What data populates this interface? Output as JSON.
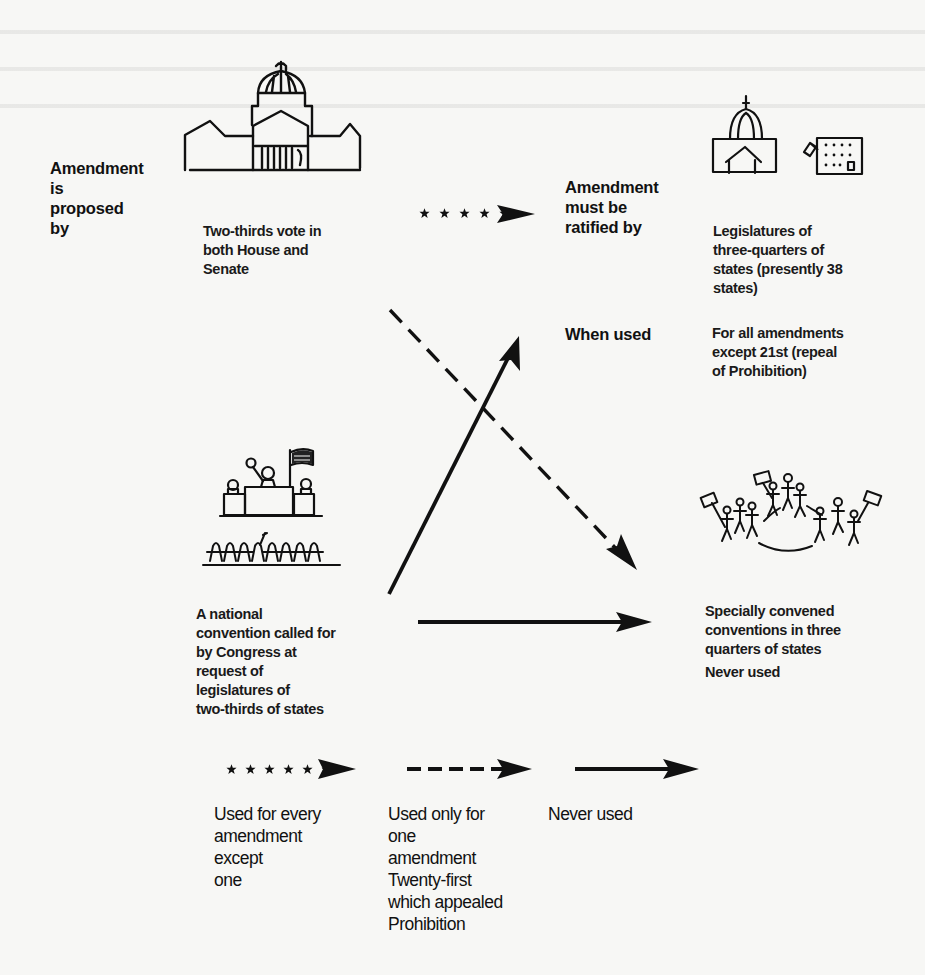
{
  "diagram": {
    "type": "flow",
    "row_headers": {
      "proposed_by": "Amendment\nis\nproposed\nby",
      "ratified_by": "Amendment\nmust be\nratified by",
      "when_used": "When used"
    },
    "proposal_methods": [
      {
        "id": "congress",
        "icon": "capitol-building-icon",
        "text": "Two-thirds vote in\nboth House and\nSenate"
      },
      {
        "id": "national-convention",
        "icon": "convention-podium-icon",
        "text": "A national\nconvention called for\nby Congress at\nrequest of\nlegislatures of\ntwo-thirds of states"
      }
    ],
    "ratification_methods": [
      {
        "id": "state-legislatures",
        "icon": "state-capitol-icon",
        "text": "Legislatures of\nthree-quarters of\nstates (presently 38\nstates)",
        "when_used": "For all amendments\nexcept 21st (repeal\nof Prohibition)"
      },
      {
        "id": "state-conventions",
        "icon": "crowd-with-signs-icon",
        "text": "Specially convened\nconventions in three\nquarters of states",
        "when_used": "Never used"
      }
    ],
    "edges": [
      {
        "from": "congress",
        "to": "state-legislatures",
        "style": "starred"
      },
      {
        "from": "congress",
        "to": "state-conventions",
        "style": "dashed"
      },
      {
        "from": "national-convention",
        "to": "state-legislatures",
        "style": "solid"
      },
      {
        "from": "national-convention",
        "to": "state-conventions",
        "style": "solid"
      }
    ],
    "legend": [
      {
        "style": "starred",
        "text": "Used for every\namendment\nexcept\none"
      },
      {
        "style": "dashed",
        "text": "Used only for\none\namendment\nTwenty-first\nwhich appealed\nProhibition"
      },
      {
        "style": "solid",
        "text": "Never used"
      }
    ]
  }
}
